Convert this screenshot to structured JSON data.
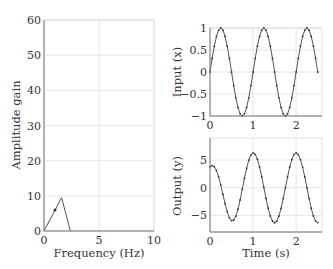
{
  "chart_data": [
    {
      "id": "amplitude",
      "type": "line",
      "title": "",
      "xlabel": "Frequency (Hz)",
      "ylabel": "Amplitude gain",
      "xlim": [
        0,
        10
      ],
      "ylim": [
        0,
        60
      ],
      "xticks": [
        0,
        5,
        10
      ],
      "yticks": [
        0,
        10,
        20,
        30,
        40,
        50,
        60
      ],
      "xtick_labels": [
        "0",
        "5",
        "10"
      ],
      "ytick_labels": [
        "0",
        "10",
        "20",
        "30",
        "40",
        "50",
        "60"
      ],
      "grid": true,
      "series": [
        {
          "name": "gain",
          "x": [
            0,
            1.6,
            2.4
          ],
          "y": [
            0,
            9.5,
            0
          ],
          "color": "#555555"
        }
      ],
      "markers": [
        {
          "x": 1.0,
          "y": 6.0
        }
      ]
    },
    {
      "id": "input",
      "type": "line",
      "title": "",
      "xlabel": "",
      "ylabel": "Input (x)",
      "xlim": [
        0,
        2.6
      ],
      "ylim": [
        -1,
        1
      ],
      "xticks": [
        0,
        1,
        2
      ],
      "yticks": [
        -1,
        -0.5,
        0,
        0.5,
        1
      ],
      "xtick_labels": [
        "0",
        "1",
        "2"
      ],
      "ytick_labels": [
        "−1",
        "−0.5",
        "0",
        "0.5",
        "1"
      ],
      "grid": true,
      "series": [
        {
          "name": "x",
          "function": "sin(2*pi*t)",
          "t_range": [
            0,
            2.5
          ],
          "samples": 51,
          "color": "#555555"
        }
      ]
    },
    {
      "id": "output",
      "type": "line",
      "title": "",
      "xlabel": "Time (s)",
      "ylabel": "Output (y)",
      "xlim": [
        0,
        2.6
      ],
      "ylim": [
        -8,
        9
      ],
      "xticks": [
        0,
        1,
        2
      ],
      "yticks": [
        -5,
        0,
        5
      ],
      "xtick_labels": [
        "0",
        "1",
        "2"
      ],
      "ytick_labels": [
        "−5",
        "0",
        "5"
      ],
      "grid": true,
      "series": [
        {
          "name": "y",
          "amplitude": 6.3,
          "transient": -2.5,
          "transient_decay": 3.0,
          "t_range": [
            0,
            2.5
          ],
          "samples": 51,
          "color": "#555555"
        }
      ]
    }
  ]
}
